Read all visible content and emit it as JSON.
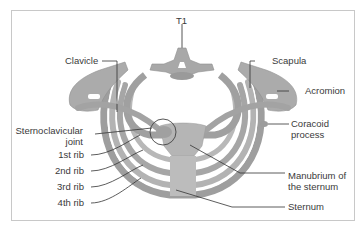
{
  "diagram": {
    "colors": {
      "bone": "#a9a9a9",
      "bone_light": "#c4c4c4",
      "bone_dark": "#8a8a8a",
      "leader_line": "#333333",
      "text": "#3a3a3a",
      "frame": "#c8c8c8"
    },
    "labels": {
      "t1": "T1",
      "clavicle": "Clavicle",
      "scapula": "Scapula",
      "acromion": "Acromion",
      "coracoid_line1": "Coracoid",
      "coracoid_line2": "process",
      "sternoclavicular_line1": "Sternoclavicular",
      "sternoclavicular_line2": "joint",
      "rib1": "1st rib",
      "rib2": "2nd rib",
      "rib3": "3rd rib",
      "rib4": "4th rib",
      "manubrium_line1": "Manubrium of",
      "manubrium_line2": "the sternum",
      "sternum": "Sternum"
    }
  }
}
